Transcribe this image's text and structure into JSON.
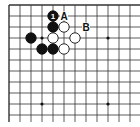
{
  "diagram": {
    "type": "go-board-corner",
    "grid": {
      "origin_x": 9,
      "origin_y": 5,
      "spacing": 11,
      "cols": 12,
      "rows": 11,
      "line_color": "#333333",
      "edge_top": true,
      "edge_left": true,
      "edge_right": false,
      "edge_bottom": false
    },
    "star_points": [
      {
        "col": 3,
        "row": 3
      },
      {
        "col": 9,
        "row": 3
      },
      {
        "col": 3,
        "row": 9
      },
      {
        "col": 9,
        "row": 9
      }
    ],
    "stones": [
      {
        "color": "black",
        "col": 4,
        "row": 1,
        "label": "1"
      },
      {
        "color": "black",
        "col": 4,
        "row": 2,
        "label": ""
      },
      {
        "color": "white",
        "col": 5,
        "row": 2,
        "label": ""
      },
      {
        "color": "black",
        "col": 2,
        "row": 3,
        "label": ""
      },
      {
        "color": "white",
        "col": 4,
        "row": 3,
        "label": ""
      },
      {
        "color": "white",
        "col": 6,
        "row": 3,
        "label": ""
      },
      {
        "color": "black",
        "col": 3,
        "row": 4,
        "label": ""
      },
      {
        "color": "black",
        "col": 4,
        "row": 4,
        "label": ""
      },
      {
        "color": "white",
        "col": 5,
        "row": 4,
        "label": ""
      }
    ],
    "markers": [
      {
        "text": "A",
        "col": 5,
        "row": 1
      },
      {
        "text": "B",
        "col": 7,
        "row": 2
      }
    ]
  }
}
